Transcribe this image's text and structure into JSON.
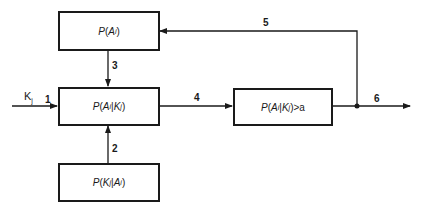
{
  "diagram": {
    "blocks": {
      "prior": {
        "func": "P",
        "open": "(",
        "var": "A",
        "sub": "i",
        "close": ")"
      },
      "posterior": {
        "func": "P",
        "open": "(",
        "var1": "A",
        "sub1": "i",
        "bar": "|",
        "var2": "K",
        "sub2": "j",
        "close": ")"
      },
      "likelihood": {
        "func": "P",
        "open": "(",
        "var1": "K",
        "sub1": "j",
        "bar": "|",
        "var2": "A",
        "sub2": "i",
        "close": ")"
      },
      "threshold": {
        "func": "P",
        "open": "(",
        "var1": "A",
        "sub1": "i",
        "bar": "|",
        "var2": "K",
        "sub2": "j",
        "close": ")",
        "op": ">",
        "threshold": "a"
      }
    },
    "input": {
      "var": "K",
      "sub": "j"
    },
    "edges": [
      {
        "id": "1",
        "from": "input",
        "to": "posterior"
      },
      {
        "id": "2",
        "from": "likelihood",
        "to": "posterior"
      },
      {
        "id": "3",
        "from": "prior",
        "to": "posterior"
      },
      {
        "id": "4",
        "from": "posterior",
        "to": "threshold"
      },
      {
        "id": "5",
        "from": "output-junction",
        "to": "prior"
      },
      {
        "id": "6",
        "from": "threshold",
        "to": "output"
      }
    ],
    "colors": {
      "line": "#1a1a1a",
      "background": "#ffffff"
    }
  }
}
